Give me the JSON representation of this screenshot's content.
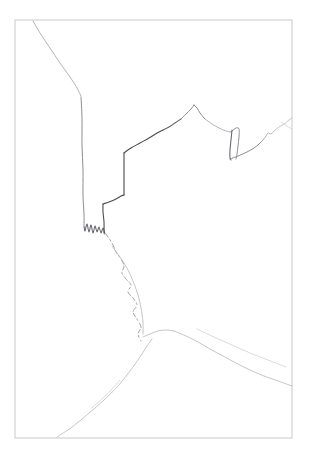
{
  "artwork": {
    "title": "Pencil Sketch — Rooftop Skyline Contour Drawing",
    "medium": "graphite pencil on white paper",
    "canvas": {
      "width": 309,
      "height": 457,
      "background": "#ffffff"
    },
    "frame": {
      "name": "drawing-border",
      "x": 15,
      "y": 20,
      "width": 277,
      "height": 418,
      "color": "#c9c9cb",
      "stroke_width": 1
    },
    "palette": {
      "paper": "#ffffff",
      "border": "#c9c9cb",
      "graphite_faint": "#bcbcc0",
      "graphite_light": "#a9a9ae",
      "graphite_mid": "#8d8d93",
      "graphite_dark": "#636369",
      "graphite_darkest": "#4a4a50",
      "graphite_ghost": "#d2d2d6"
    },
    "strokes": [
      {
        "name": "upper-left-descending-edge",
        "weight": "light",
        "points": "33,21 40,33 50,48 60,63 70,77 77,88 81,96"
      },
      {
        "name": "left-tall-vertical-wall",
        "weight": "mid",
        "points": "81,97 82,118 82,145 83,170 83,196 84,214 84,225"
      },
      {
        "name": "left-wall-base-jagged-texture",
        "weight": "dark",
        "points": "84,226 85,231 87,224 89,232 91,225 93,233 95,226 97,232 99,227 101,233 103,228 105,234"
      },
      {
        "name": "left-parapet-riser",
        "weight": "darkest",
        "points": "104,233 104,222 103,212 103,204"
      },
      {
        "name": "lower-roof-ledge",
        "weight": "darkest",
        "points": "103,204 109,202 116,199 121,196 124,195"
      },
      {
        "name": "middle-vertical-riser",
        "weight": "darkest",
        "points": "124,195 124,182 124,168 124,156 124,153"
      },
      {
        "name": "upper-roof-slope-left",
        "weight": "darkest",
        "points": "124,153 131,148 140,143 149,138 157,133 163,130"
      },
      {
        "name": "roof-ridge-mid-kink",
        "weight": "dark",
        "points": "163,130 169,127 175,123 181,119"
      },
      {
        "name": "roof-rise-to-peak",
        "weight": "mid",
        "points": "181,119 186,114 191,109 194,105"
      },
      {
        "name": "roof-peak-apex",
        "weight": "mid",
        "points": "194,105 197,108 200,113 205,119"
      },
      {
        "name": "roof-slope-right",
        "weight": "light",
        "points": "205,119 212,124 219,128 226,131 231,132"
      },
      {
        "name": "right-notch-outer",
        "weight": "mid",
        "points": "231,132 236,128 239,129 239,137 238,146 237,154 236,159"
      },
      {
        "name": "right-notch-inner-return",
        "weight": "dark",
        "points": "232,130 231,140 230,150 230,158 231,160"
      },
      {
        "name": "right-lower-ledge",
        "weight": "mid",
        "points": "230,159 238,156 247,152 254,148 259,144 263,140"
      },
      {
        "name": "right-small-step",
        "weight": "light",
        "points": "263,140 266,136 268,133 271,134 274,131"
      },
      {
        "name": "right-edge-rise",
        "weight": "faint",
        "points": "274,131 279,127 284,124 289,120 292,118"
      },
      {
        "name": "central-wiggly-dashed-path",
        "weight": "wiggle",
        "points": "106,234 112,243 116,252 121,259 124,266 122,273 126,279 131,285 128,292 133,298 137,305 133,312 137,319 141,327 138,334 141,341"
      },
      {
        "name": "mid-hill-faint-ridge",
        "weight": "faint",
        "points": "112,246 120,257 127,268 133,281 138,295 141,308 143,322 143,334"
      },
      {
        "name": "lower-left-slope-foreground",
        "weight": "faint",
        "points": "57,437 72,427 88,414 104,400 118,386 130,371 140,357 147,346 152,339"
      },
      {
        "name": "lower-left-slope-accent",
        "weight": "ghost",
        "points": "92,408 103,398 112,389 120,380"
      },
      {
        "name": "central-hill-summit",
        "weight": "faint",
        "points": "143,337 150,334 158,331 166,330 174,331"
      },
      {
        "name": "right-descending-slope",
        "weight": "faint",
        "points": "174,331 186,336 198,342 210,349 223,356 236,363 250,370 264,376 278,381 292,386"
      },
      {
        "name": "right-slope-ghost-echo",
        "weight": "ghost",
        "points": "197,329 214,337 232,345 250,353 268,360 286,367"
      },
      {
        "name": "far-right-upper-fragment",
        "weight": "ghost",
        "points": "281,122 287,126 292,129"
      }
    ]
  }
}
